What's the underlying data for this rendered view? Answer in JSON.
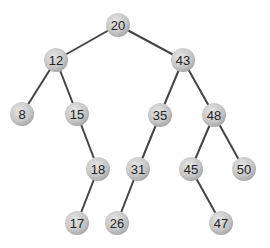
{
  "diagram": {
    "type": "binary-search-tree",
    "node_fill": "#c8c8c8",
    "edge_color": "#444444",
    "nodes": [
      {
        "id": "n20",
        "label": "20",
        "x": 118,
        "y": 25
      },
      {
        "id": "n12",
        "label": "12",
        "x": 56,
        "y": 60
      },
      {
        "id": "n43",
        "label": "43",
        "x": 183,
        "y": 60
      },
      {
        "id": "n8",
        "label": "8",
        "x": 22,
        "y": 114
      },
      {
        "id": "n15",
        "label": "15",
        "x": 77,
        "y": 114
      },
      {
        "id": "n35",
        "label": "35",
        "x": 160,
        "y": 115
      },
      {
        "id": "n48",
        "label": "48",
        "x": 214,
        "y": 115
      },
      {
        "id": "n18",
        "label": "18",
        "x": 98,
        "y": 169
      },
      {
        "id": "n31",
        "label": "31",
        "x": 138,
        "y": 169
      },
      {
        "id": "n45",
        "label": "45",
        "x": 191,
        "y": 169
      },
      {
        "id": "n50",
        "label": "50",
        "x": 244,
        "y": 169
      },
      {
        "id": "n17",
        "label": "17",
        "x": 77,
        "y": 223
      },
      {
        "id": "n26",
        "label": "26",
        "x": 117,
        "y": 223
      },
      {
        "id": "n47",
        "label": "47",
        "x": 221,
        "y": 223
      }
    ],
    "edges": [
      [
        "n20",
        "n12"
      ],
      [
        "n20",
        "n43"
      ],
      [
        "n12",
        "n8"
      ],
      [
        "n12",
        "n15"
      ],
      [
        "n43",
        "n35"
      ],
      [
        "n43",
        "n48"
      ],
      [
        "n15",
        "n18"
      ],
      [
        "n35",
        "n31"
      ],
      [
        "n48",
        "n45"
      ],
      [
        "n48",
        "n50"
      ],
      [
        "n18",
        "n17"
      ],
      [
        "n31",
        "n26"
      ],
      [
        "n45",
        "n47"
      ]
    ]
  }
}
